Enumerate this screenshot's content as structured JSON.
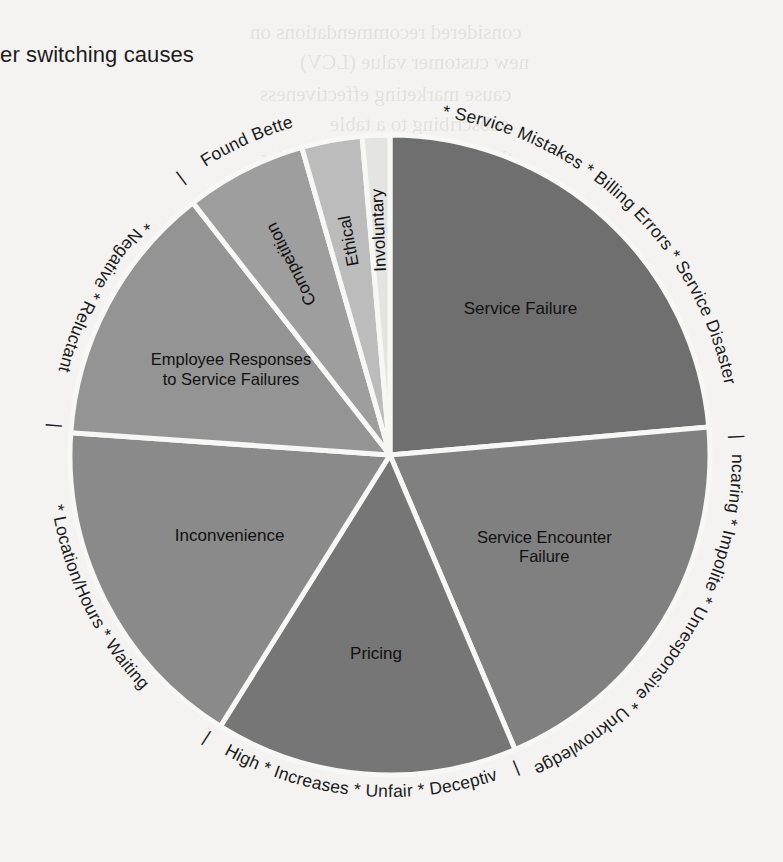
{
  "page": {
    "title": "stomer switching causes",
    "title_full_hint": "stomer switching causes",
    "background_color": "#f4f3f1"
  },
  "ghost_text": [
    {
      "text": "considered recommendations on",
      "x": 250,
      "y": 20
    },
    {
      "text": "new customer value (LCV)",
      "x": 300,
      "y": 50
    },
    {
      "text": "cause marketing effectiveness",
      "x": 260,
      "y": 82
    },
    {
      "text": "subscribing to a table",
      "x": 330,
      "y": 112
    },
    {
      "text": "the bottom line and after sales",
      "x": 260,
      "y": 146
    },
    {
      "text": "in the first level of the",
      "x": 300,
      "y": 560
    },
    {
      "text": "brand has customer",
      "x": 330,
      "y": 590
    },
    {
      "text": "customers simply",
      "x": 340,
      "y": 618
    },
    {
      "text": "to such the customers simply",
      "x": 300,
      "y": 648
    }
  ],
  "chart_data": {
    "type": "pie",
    "title": "stomer switching causes",
    "center": {
      "x": 390,
      "y": 455
    },
    "radius": 320,
    "start_angle_deg": 0,
    "direction": "clockwise",
    "legend": "none",
    "grid": false,
    "labels_on_slices": true,
    "categories": [
      "Service Failure",
      "Service Encounter Failure",
      "Pricing",
      "Inconvenience",
      "Employee Responses to Service Failures",
      "Competition",
      "Ethical",
      "Involuntary"
    ],
    "values": [
      23.6,
      20.0,
      15.3,
      17.2,
      13.3,
      6.1,
      3.1,
      1.4
    ],
    "unit": "percent",
    "slices": [
      {
        "label": "Service Failure",
        "label_lines": [
          "Service Failure"
        ],
        "value": 23.6,
        "start_deg": 0,
        "sweep_deg": 85,
        "color": "#6f6f6f",
        "label_r": 195,
        "label_angle_deg": 42,
        "rim_text": "* Service Mistakes * Billing Errors * Service Disaster",
        "sub_causes": [
          "Service Mistakes",
          "Billing Errors",
          "Service Disaster"
        ]
      },
      {
        "label": "Service Encounter Failure",
        "label_lines": [
          "Service Encounter",
          "Failure"
        ],
        "value": 20.0,
        "start_deg": 85,
        "sweep_deg": 72,
        "color": "#808080",
        "label_r": 180,
        "label_angle_deg": 121,
        "rim_text": "* Uncaring * Impolite * Unresponsive * Unknowledgeale",
        "sub_causes": [
          "Uncaring",
          "Impolite",
          "Unresponsive",
          "Unknowledgeale"
        ]
      },
      {
        "label": "Pricing",
        "label_lines": [
          "Pricing"
        ],
        "value": 15.3,
        "start_deg": 157,
        "sweep_deg": 55,
        "color": "#767676",
        "label_r": 200,
        "label_angle_deg": 184,
        "rim_text": "* High * Increases * Unfair * Deceptive",
        "sub_causes": [
          "High",
          "Increases",
          "Unfair",
          "Deceptive"
        ]
      },
      {
        "label": "Inconvenience",
        "label_lines": [
          "Inconvenience"
        ],
        "value": 17.2,
        "start_deg": 212,
        "sweep_deg": 62,
        "color": "#8a8a8a",
        "label_r": 180,
        "label_angle_deg": 243,
        "rim_text": "* Location/Hours * Waiting",
        "sub_causes": [
          "Location/Hours",
          "Waiting"
        ]
      },
      {
        "label": "Employee Responses to Service Failures",
        "label_lines": [
          "Employee Responses",
          "to Service Failures"
        ],
        "value": 13.3,
        "start_deg": 274,
        "sweep_deg": 48,
        "color": "#949494",
        "label_r": 180,
        "label_angle_deg": 298,
        "rim_text": "* Negative * Reluctant",
        "sub_causes": [
          "Negative",
          "Reluctant"
        ]
      },
      {
        "label": "Competition",
        "label_lines": [
          "Competition"
        ],
        "value": 6.1,
        "start_deg": 322,
        "sweep_deg": 22,
        "color": "#9e9e9e",
        "label_r": 215,
        "label_angle_deg": 333,
        "rim_text": "* Found Better",
        "sub_causes": [
          "Found Better"
        ]
      },
      {
        "label": "Ethical",
        "label_lines": [
          "Ethical"
        ],
        "value": 3.1,
        "start_deg": 344,
        "sweep_deg": 11,
        "color": "#bcbcbc",
        "label_r": 218,
        "label_angle_deg": 349.5,
        "rim_text": "",
        "sub_causes": []
      },
      {
        "label": "Involuntary",
        "label_lines": [
          "Involuntary"
        ],
        "value": 1.4,
        "start_deg": 355,
        "sweep_deg": 5,
        "color": "#e4e4e2",
        "label_r": 225,
        "label_angle_deg": 357.5,
        "rim_text": "",
        "sub_causes": []
      }
    ],
    "rim_groups": [
      {
        "id": "rim-service-failure",
        "text": "* Service Mistakes * Billing Errors * Service Disaster",
        "start_deg": 3,
        "end_deg": 84
      },
      {
        "id": "rim-separator-1",
        "text": "|",
        "start_deg": 86,
        "end_deg": 88
      },
      {
        "id": "rim-encounter-failure",
        "text": "* Uncaring * Impolite * Unresponsive * Unknowledgeale",
        "start_deg": 90,
        "end_deg": 155
      },
      {
        "id": "rim-separator-2",
        "text": "|",
        "start_deg": 157,
        "end_deg": 159
      },
      {
        "id": "rim-pricing",
        "text": "* High * Increases * Unfair * Deceptive",
        "start_deg": 161,
        "end_deg": 210
      },
      {
        "id": "rim-separator-3",
        "text": "|",
        "start_deg": 212,
        "end_deg": 214
      },
      {
        "id": "rim-inconvenience",
        "text": "* Location/Hours * Waiting",
        "start_deg": 216,
        "end_deg": 272
      },
      {
        "id": "rim-separator-4",
        "text": "|",
        "start_deg": 274,
        "end_deg": 276
      },
      {
        "id": "rim-employee-responses",
        "text": "* Negative * Reluctant",
        "start_deg": 278,
        "end_deg": 320
      },
      {
        "id": "rim-separator-5",
        "text": "|",
        "start_deg": 322,
        "end_deg": 324
      },
      {
        "id": "rim-competition",
        "text": "* Found Better",
        "start_deg": 326,
        "end_deg": 344
      }
    ],
    "colors": {
      "slice_darkest": "#6f6f6f",
      "slice_lightest": "#e4e4e2",
      "separator_stroke": "#f7f7f5",
      "text": "#111111"
    }
  }
}
